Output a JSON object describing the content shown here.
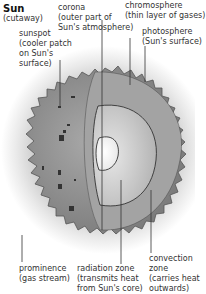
{
  "title": {
    "name": "Sun",
    "subtitle": "(cutaway)"
  },
  "labels": {
    "corona": {
      "name": "corona",
      "desc1": "(outer part of",
      "desc2": "Sun's atmosphere)"
    },
    "chromosphere": {
      "name": "chromosphere",
      "desc1": "(thin layer of gases)"
    },
    "photosphere": {
      "name": "photosphere",
      "desc1": "(Sun's surface)"
    },
    "sunspot": {
      "name": "sunspot",
      "desc1": "(cooler patch",
      "desc2": "on Sun's",
      "desc3": "surface)"
    },
    "prominence": {
      "name": "prominence",
      "desc1": "(gas stream)"
    },
    "radiation_zone": {
      "name": "radiation zone",
      "desc1": "(transmits heat",
      "desc2": "from Sun's core)"
    },
    "convection_zone": {
      "name": "convection",
      "desc1": "zone",
      "desc2": "(carries heat",
      "desc3": "outwards)"
    }
  },
  "colors": {
    "sun_surface": "#8f8f8f",
    "cut_face": "#a6a6a6",
    "radiation": "#c4c4c4",
    "core": "#f4f4f4",
    "line": "#333333",
    "corona_glow": "#d9d9d9"
  }
}
